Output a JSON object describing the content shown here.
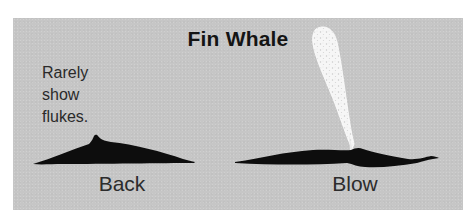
{
  "figure": {
    "title": "Fin Whale",
    "note_lines": [
      "Rarely",
      "show",
      "flukes."
    ],
    "panels": [
      {
        "id": "back",
        "label": "Back"
      },
      {
        "id": "blow",
        "label": "Blow"
      }
    ],
    "colors": {
      "background": "#c6c6c6",
      "whale": "#0d0d0d",
      "blow": "#f4f4f4",
      "text": "#2a2a2a"
    }
  }
}
